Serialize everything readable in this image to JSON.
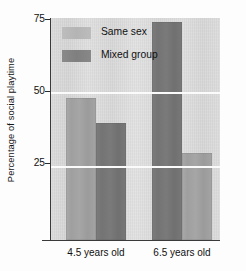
{
  "chart_data": {
    "type": "bar",
    "title": "",
    "subtitle": "",
    "xlabel": "",
    "ylabel": "Percentage of social playtime",
    "categories": [
      "4.5 years old",
      "6.5 years old"
    ],
    "series": [
      {
        "name": "Same sex",
        "values": [
          48,
          73.5
        ],
        "color": "#a4a4a4"
      },
      {
        "name": "Mixed group",
        "values": [
          39.5,
          29.5
        ],
        "color": "#787878"
      }
    ],
    "ylim": [
      0,
      75
    ],
    "yticks": [
      25,
      50,
      75
    ],
    "ytick_labels": [
      "25",
      "50",
      "75"
    ],
    "gridlines": [
      25,
      50
    ],
    "grid": true,
    "legend_position": "top-left-inside",
    "plot_background": "#dcdcdc",
    "gridline_color": "#fbfbfb",
    "axis_color": "#3a3a3a"
  },
  "axis": {
    "y_title": "Percentage of social playtime",
    "tick_75": "75",
    "tick_50": "50",
    "tick_25": "25"
  },
  "legend": {
    "items": [
      {
        "label": "Same sex"
      },
      {
        "label": "Mixed group"
      }
    ]
  },
  "xaxis": {
    "labels": [
      {
        "text": "4.5 years old"
      },
      {
        "text": "6.5 years old"
      }
    ]
  }
}
